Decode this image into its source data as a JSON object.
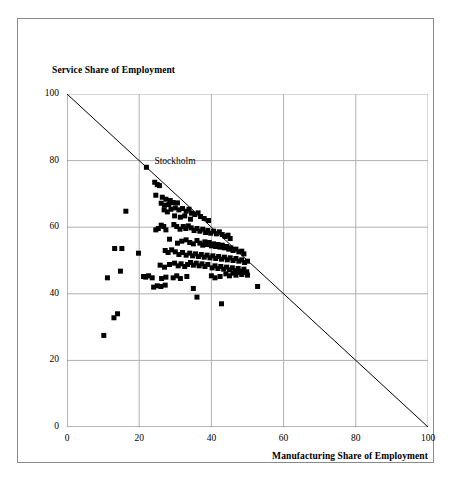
{
  "chart_data": {
    "type": "scatter",
    "title": "",
    "xlabel": "Manufacturing Share of Employment",
    "ylabel": "Service Share of Employment",
    "xlim": [
      0,
      100
    ],
    "ylim": [
      0,
      100
    ],
    "xticks": [
      0,
      20,
      40,
      60,
      80,
      100
    ],
    "yticks": [
      0,
      20,
      40,
      60,
      80,
      100
    ],
    "xticklabels": [
      "0",
      "20",
      "40",
      "60",
      "80",
      "100"
    ],
    "yticklabels": [
      "0",
      "20",
      "40",
      "60",
      "80",
      "100"
    ],
    "grid": true,
    "grid_color": "#b0b0b0",
    "legend": "none",
    "marker": "square",
    "marker_color": "#000000",
    "marker_size_px": 5,
    "reference_line": {
      "label": "",
      "from": [
        0,
        100
      ],
      "to": [
        100,
        0
      ],
      "color": "#000000",
      "width": 1
    },
    "annotations": [
      {
        "text": "Stockholm",
        "x": 22.0,
        "y": 78.0,
        "dx_px": 8,
        "dy_px": -5
      }
    ],
    "series": [
      {
        "name": "Regions",
        "points": [
          [
            22.0,
            78.0
          ],
          [
            24.3,
            73.5
          ],
          [
            25.0,
            72.8
          ],
          [
            25.6,
            72.5
          ],
          [
            24.6,
            69.6
          ],
          [
            26.4,
            69.0
          ],
          [
            27.4,
            68.4
          ],
          [
            28.6,
            68.0
          ],
          [
            26.1,
            67.2
          ],
          [
            27.0,
            66.6
          ],
          [
            28.2,
            66.8
          ],
          [
            29.4,
            67.4
          ],
          [
            30.6,
            67.3
          ],
          [
            26.9,
            65.2
          ],
          [
            27.8,
            64.6
          ],
          [
            28.8,
            65.4
          ],
          [
            30.0,
            65.8
          ],
          [
            31.0,
            65.2
          ],
          [
            32.0,
            65.6
          ],
          [
            33.0,
            64.8
          ],
          [
            33.8,
            65.4
          ],
          [
            34.5,
            64.2
          ],
          [
            35.4,
            63.8
          ],
          [
            36.3,
            64.3
          ],
          [
            37.0,
            63.2
          ],
          [
            38.0,
            62.6
          ],
          [
            39.2,
            62.0
          ],
          [
            16.3,
            64.8
          ],
          [
            29.8,
            63.4
          ],
          [
            31.4,
            63.0
          ],
          [
            32.6,
            63.4
          ],
          [
            34.2,
            62.4
          ],
          [
            24.6,
            59.2
          ],
          [
            25.3,
            59.6
          ],
          [
            26.1,
            60.6
          ],
          [
            26.8,
            60.2
          ],
          [
            27.4,
            59.2
          ],
          [
            29.6,
            60.8
          ],
          [
            30.4,
            60.2
          ],
          [
            31.3,
            59.4
          ],
          [
            32.2,
            60.2
          ],
          [
            32.9,
            59.6
          ],
          [
            33.6,
            60.4
          ],
          [
            34.4,
            59.8
          ],
          [
            35.2,
            59.0
          ],
          [
            36.0,
            59.6
          ],
          [
            36.8,
            58.8
          ],
          [
            37.6,
            59.4
          ],
          [
            38.4,
            58.4
          ],
          [
            39.0,
            59.0
          ],
          [
            39.8,
            58.2
          ],
          [
            40.6,
            58.8
          ],
          [
            41.4,
            58.0
          ],
          [
            42.2,
            58.6
          ],
          [
            43.0,
            57.8
          ],
          [
            43.8,
            57.2
          ],
          [
            44.6,
            57.6
          ],
          [
            45.2,
            56.6
          ],
          [
            28.4,
            56.4
          ],
          [
            30.6,
            55.2
          ],
          [
            31.8,
            55.8
          ],
          [
            33.0,
            56.2
          ],
          [
            34.0,
            55.4
          ],
          [
            35.0,
            55.0
          ],
          [
            36.0,
            56.0
          ],
          [
            36.8,
            55.2
          ],
          [
            37.6,
            54.6
          ],
          [
            38.2,
            55.6
          ],
          [
            38.8,
            54.8
          ],
          [
            39.4,
            55.4
          ],
          [
            40.0,
            54.4
          ],
          [
            40.6,
            55.0
          ],
          [
            41.2,
            54.2
          ],
          [
            41.8,
            54.8
          ],
          [
            42.4,
            54.0
          ],
          [
            43.0,
            54.6
          ],
          [
            43.6,
            53.8
          ],
          [
            44.2,
            54.2
          ],
          [
            44.8,
            53.4
          ],
          [
            45.4,
            53.8
          ],
          [
            46.0,
            53.0
          ],
          [
            46.8,
            53.4
          ],
          [
            47.6,
            52.6
          ],
          [
            48.4,
            52.8
          ],
          [
            49.0,
            52.0
          ],
          [
            13.2,
            53.6
          ],
          [
            15.2,
            53.6
          ],
          [
            19.8,
            52.2
          ],
          [
            27.2,
            53.0
          ],
          [
            28.0,
            52.4
          ],
          [
            29.0,
            53.2
          ],
          [
            30.0,
            52.6
          ],
          [
            31.0,
            51.8
          ],
          [
            32.0,
            52.4
          ],
          [
            33.0,
            51.6
          ],
          [
            34.0,
            52.2
          ],
          [
            34.8,
            51.4
          ],
          [
            35.6,
            52.0
          ],
          [
            36.4,
            51.2
          ],
          [
            37.2,
            51.8
          ],
          [
            38.0,
            51.0
          ],
          [
            38.8,
            51.6
          ],
          [
            39.6,
            50.8
          ],
          [
            40.4,
            51.4
          ],
          [
            41.2,
            50.6
          ],
          [
            42.0,
            51.2
          ],
          [
            42.8,
            50.4
          ],
          [
            43.6,
            51.0
          ],
          [
            44.4,
            50.2
          ],
          [
            45.2,
            50.8
          ],
          [
            46.0,
            50.0
          ],
          [
            46.8,
            50.6
          ],
          [
            47.6,
            49.8
          ],
          [
            48.4,
            50.2
          ],
          [
            49.2,
            49.4
          ],
          [
            50.0,
            49.8
          ],
          [
            25.8,
            48.6
          ],
          [
            27.0,
            48.0
          ],
          [
            28.4,
            48.8
          ],
          [
            29.8,
            49.2
          ],
          [
            30.8,
            48.4
          ],
          [
            31.6,
            49.0
          ],
          [
            32.6,
            48.2
          ],
          [
            33.4,
            48.8
          ],
          [
            34.2,
            49.4
          ],
          [
            35.0,
            48.6
          ],
          [
            35.8,
            49.2
          ],
          [
            36.6,
            48.4
          ],
          [
            37.4,
            49.0
          ],
          [
            38.2,
            48.2
          ],
          [
            39.0,
            48.8
          ],
          [
            40.2,
            47.8
          ],
          [
            41.0,
            48.4
          ],
          [
            41.8,
            47.6
          ],
          [
            42.6,
            48.2
          ],
          [
            43.4,
            47.4
          ],
          [
            44.2,
            48.0
          ],
          [
            45.0,
            47.2
          ],
          [
            45.8,
            47.8
          ],
          [
            46.6,
            47.0
          ],
          [
            47.4,
            47.6
          ],
          [
            48.2,
            46.8
          ],
          [
            49.0,
            47.4
          ],
          [
            49.8,
            46.6
          ],
          [
            14.8,
            46.8
          ],
          [
            11.2,
            44.8
          ],
          [
            21.2,
            45.2
          ],
          [
            21.8,
            45.0
          ],
          [
            22.6,
            45.4
          ],
          [
            23.6,
            44.8
          ],
          [
            26.2,
            44.6
          ],
          [
            27.4,
            45.0
          ],
          [
            29.4,
            44.8
          ],
          [
            30.4,
            45.4
          ],
          [
            31.4,
            44.6
          ],
          [
            33.2,
            45.2
          ],
          [
            40.0,
            45.4
          ],
          [
            41.0,
            44.8
          ],
          [
            42.4,
            45.2
          ],
          [
            44.0,
            46.0
          ],
          [
            45.0,
            45.4
          ],
          [
            46.0,
            46.2
          ],
          [
            46.8,
            45.6
          ],
          [
            47.6,
            46.4
          ],
          [
            48.4,
            45.8
          ],
          [
            49.2,
            46.4
          ],
          [
            50.0,
            45.6
          ],
          [
            24.0,
            42.0
          ],
          [
            25.0,
            42.4
          ],
          [
            26.0,
            42.2
          ],
          [
            27.2,
            42.6
          ],
          [
            35.0,
            41.6
          ],
          [
            52.8,
            42.2
          ],
          [
            36.0,
            39.0
          ],
          [
            42.8,
            37.0
          ],
          [
            13.0,
            32.8
          ],
          [
            14.0,
            34.0
          ],
          [
            10.2,
            27.5
          ]
        ]
      }
    ]
  },
  "axes": {
    "y_title": "Service Share of Employment",
    "x_title": "Manufacturing Share of Employment"
  }
}
